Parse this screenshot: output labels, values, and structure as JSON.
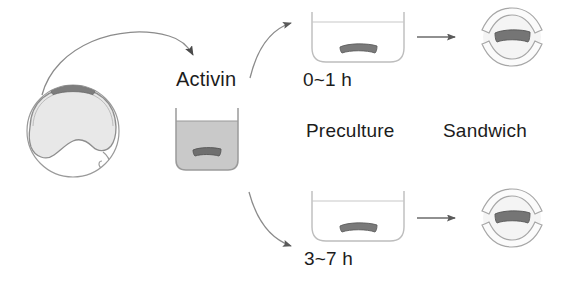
{
  "figure": {
    "background_color": "#ffffff",
    "line_color": "#8a8a8a",
    "dark_line_color": "#4a4a4a",
    "explant_color": "#6f6f6f",
    "explant_stroke": "#4f4f4f",
    "cap_color": "#7d7d7d",
    "liquid_color": "#c9c9c9",
    "embryo_fill": "#e6e6e6",
    "text_color": "#1c1c1c"
  },
  "labels": {
    "activin": "Activin",
    "time_top": "0~1 h",
    "time_bottom": "3~7 h",
    "preculture": "Preculture",
    "sandwich": "Sandwich"
  },
  "nodes": {
    "embryo": {
      "name": "embryo-diagram",
      "description": "Cross-section of embryo with dark animal cap at top"
    },
    "activin_beaker": {
      "name": "activin-beaker",
      "description": "Beaker filled with activin solution containing explant"
    },
    "preculture_dish_top": {
      "name": "preculture-dish-top",
      "time": "0~1 h"
    },
    "preculture_dish_bottom": {
      "name": "preculture-dish-bottom",
      "time": "3~7 h"
    },
    "sandwich_top": {
      "name": "sandwich-top"
    },
    "sandwich_bottom": {
      "name": "sandwich-bottom"
    }
  },
  "arrows": {
    "embryo_to_activin": "curved-arrow-embryo-to-activin",
    "activin_to_top": "curved-arrow-activin-to-top-dish",
    "activin_to_bottom": "curved-arrow-activin-to-bottom-dish",
    "top_dish_to_sandwich": "straight-arrow-top",
    "bottom_dish_to_sandwich": "straight-arrow-bottom"
  }
}
